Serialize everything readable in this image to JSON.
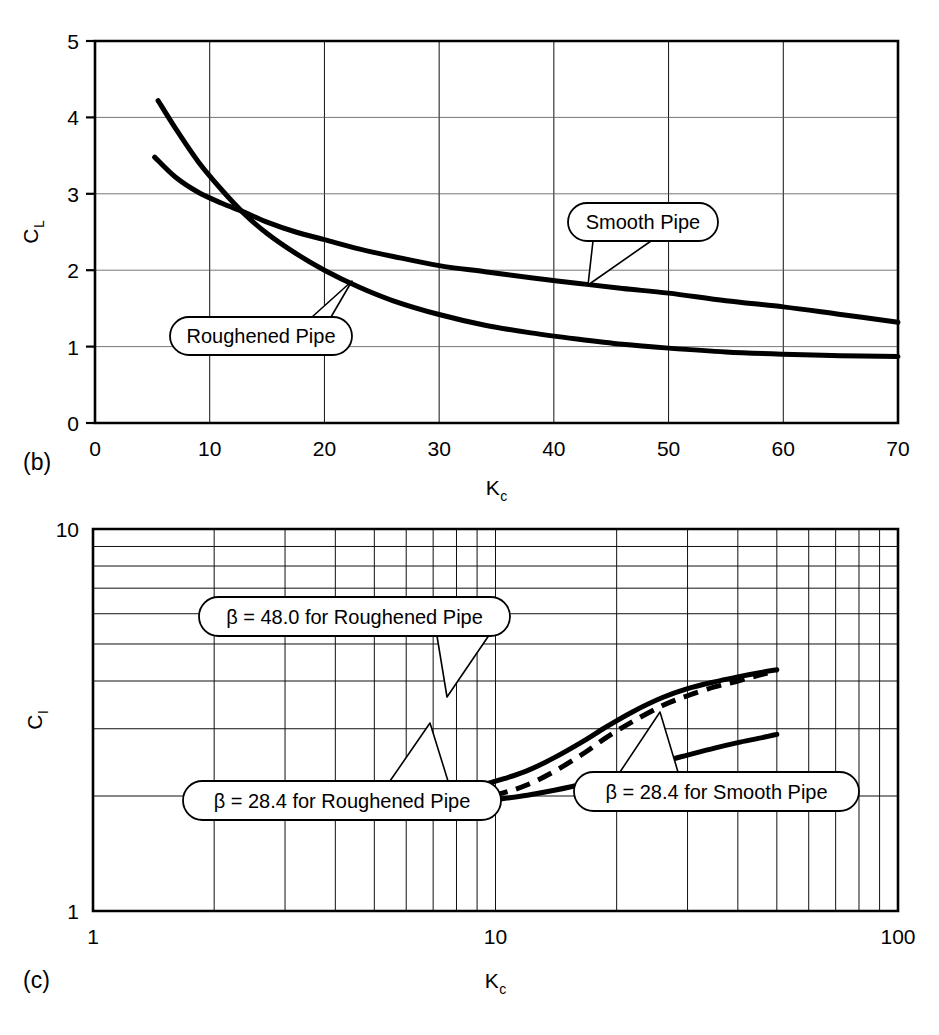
{
  "figure": {
    "panels": [
      {
        "id": "b",
        "label": "(b)"
      },
      {
        "id": "c",
        "label": "(c)"
      }
    ]
  },
  "chart_data": [
    {
      "type": "line",
      "panel": "(b)",
      "title": "",
      "xlabel": "Kc",
      "xlabel_base": "K",
      "xlabel_sub": "c",
      "ylabel": "CL",
      "ylabel_base": "C",
      "ylabel_sub": "L",
      "xscale": "linear",
      "yscale": "linear",
      "xlim": [
        0,
        70
      ],
      "ylim": [
        0,
        5
      ],
      "xticks": [
        0,
        10,
        20,
        30,
        40,
        50,
        60,
        70
      ],
      "xtick_labels": [
        "0",
        "10",
        "20",
        "30",
        "40",
        "50",
        "60",
        "70"
      ],
      "yticks": [
        0,
        1,
        2,
        3,
        4,
        5
      ],
      "ytick_labels": [
        "0",
        "1",
        "2",
        "3",
        "4",
        "5"
      ],
      "grid": true,
      "legend_position": "inline-callouts",
      "series": [
        {
          "name": "Smooth Pipe",
          "style": "solid",
          "x": [
            5.2,
            7,
            9,
            11,
            13,
            15,
            17.5,
            20,
            23,
            26,
            30,
            34,
            38,
            42,
            46,
            50,
            55,
            60,
            65,
            70
          ],
          "y": [
            3.48,
            3.22,
            3.02,
            2.88,
            2.76,
            2.63,
            2.5,
            2.4,
            2.28,
            2.18,
            2.06,
            1.98,
            1.9,
            1.83,
            1.76,
            1.7,
            1.6,
            1.52,
            1.42,
            1.32
          ]
        },
        {
          "name": "Roughened Pipe",
          "style": "solid",
          "x": [
            5.5,
            7,
            9,
            11,
            13,
            15,
            17.5,
            20,
            23,
            26,
            30,
            34,
            38,
            42,
            46,
            50,
            55,
            60,
            65,
            70
          ],
          "y": [
            4.22,
            3.86,
            3.42,
            3.06,
            2.74,
            2.48,
            2.22,
            2.0,
            1.78,
            1.6,
            1.42,
            1.28,
            1.18,
            1.1,
            1.03,
            0.98,
            0.93,
            0.9,
            0.88,
            0.87
          ]
        }
      ],
      "annotations": [
        {
          "text": "Smooth Pipe",
          "box": {
            "x": 568,
            "y": 203,
            "w": 150,
            "h": 38
          },
          "tail_to": {
            "x": 588,
            "y": 285
          }
        },
        {
          "text": "Roughened Pipe",
          "box": {
            "x": 170,
            "y": 317,
            "w": 182,
            "h": 38
          },
          "tail_to": {
            "x": 352,
            "y": 281
          }
        }
      ]
    },
    {
      "type": "line",
      "panel": "(c)",
      "title": "",
      "xlabel": "Kc",
      "xlabel_base": "K",
      "xlabel_sub": "c",
      "ylabel": "CI",
      "ylabel_base": "C",
      "ylabel_sub": "I",
      "xscale": "log",
      "yscale": "log",
      "xlim": [
        1,
        100
      ],
      "ylim": [
        1,
        10
      ],
      "xticks": [
        1,
        10,
        100
      ],
      "xtick_labels": [
        "1",
        "10",
        "100"
      ],
      "yticks": [
        1,
        10
      ],
      "ytick_labels": [
        "1",
        "10"
      ],
      "minor_decade_steps": [
        2,
        3,
        4,
        5,
        6,
        7,
        8,
        9
      ],
      "grid": true,
      "legend_position": "inline-callouts",
      "series": [
        {
          "name": "beta = 48.0 for Roughened Pipe",
          "style": "solid",
          "x": [
            5.0,
            6.0,
            7.0,
            8.0,
            9.0,
            10.5,
            12.0,
            14.0,
            16.5,
            19.0,
            22.0,
            26.0,
            30.0,
            35.0,
            40.0,
            45.0,
            50.0
          ],
          "y": [
            1.88,
            1.94,
            2.0,
            2.06,
            2.12,
            2.22,
            2.33,
            2.52,
            2.78,
            3.05,
            3.33,
            3.62,
            3.82,
            3.98,
            4.1,
            4.2,
            4.28
          ]
        },
        {
          "name": "beta = 28.4 for Roughened Pipe",
          "style": "dashed",
          "x": [
            5.0,
            6.0,
            7.0,
            8.0,
            9.0,
            10.5,
            12.0,
            14.0,
            16.5,
            19.0,
            22.0,
            26.0,
            30.0,
            35.0,
            40.0,
            45.0,
            50.0
          ],
          "y": [
            1.8,
            1.84,
            1.88,
            1.92,
            1.96,
            2.04,
            2.14,
            2.32,
            2.58,
            2.86,
            3.14,
            3.45,
            3.66,
            3.86,
            4.0,
            4.14,
            4.26
          ]
        },
        {
          "name": "beta = 28.4 for Smooth Pipe",
          "style": "solid",
          "x": [
            5.0,
            6.0,
            7.0,
            8.0,
            9.0,
            10.5,
            12.0,
            14.0,
            16.5,
            19.0,
            22.0,
            26.0,
            30.0,
            35.0,
            40.0,
            45.0,
            50.0
          ],
          "y": [
            1.82,
            1.85,
            1.88,
            1.9,
            1.93,
            1.97,
            2.01,
            2.07,
            2.15,
            2.24,
            2.34,
            2.46,
            2.56,
            2.67,
            2.76,
            2.83,
            2.9
          ]
        }
      ],
      "annotations": [
        {
          "text": "β = 48.0 for Roughened Pipe",
          "box": {
            "x": 199,
            "y": 597,
            "w": 311,
            "h": 39
          },
          "tail_to": {
            "x": 447,
            "y": 697
          }
        },
        {
          "text": "β = 28.4 for Roughened Pipe",
          "box": {
            "x": 183,
            "y": 781,
            "w": 318,
            "h": 39
          },
          "tail_to": {
            "x": 430,
            "y": 723
          }
        },
        {
          "text": "β = 28.4 for Smooth Pipe",
          "box": {
            "x": 574,
            "y": 772,
            "w": 285,
            "h": 39
          },
          "tail_to": {
            "x": 660,
            "y": 712
          }
        }
      ]
    }
  ]
}
